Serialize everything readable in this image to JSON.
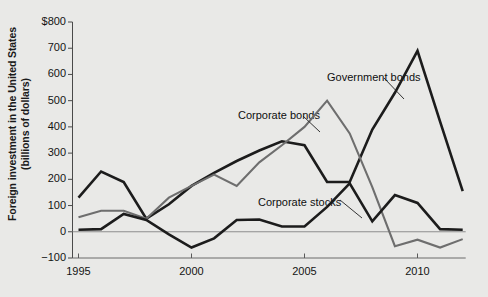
{
  "chart_data": {
    "type": "line",
    "title": "",
    "xlabel": "",
    "ylabel": "Foreign investment in the United States (billions of dollars)",
    "ylabel_line1": "Foreign investment in the United States",
    "ylabel_line2": "(billions of dollars)",
    "ylim": [
      -100,
      800
    ],
    "xlim": [
      1995,
      2012
    ],
    "ytick_labels": [
      "$800",
      "700",
      "600",
      "500",
      "400",
      "300",
      "200",
      "100",
      "0",
      "−100"
    ],
    "ytick_values": [
      800,
      700,
      600,
      500,
      400,
      300,
      200,
      100,
      0,
      -100
    ],
    "xtick_labels": [
      "1995",
      "2000",
      "2005",
      "2010"
    ],
    "xtick_values": [
      1995,
      2000,
      2005,
      2010
    ],
    "grid": false,
    "zero_line": true,
    "legend_position": "inline-annotations",
    "x": [
      1995,
      1996,
      1997,
      1998,
      1999,
      2000,
      2001,
      2002,
      2003,
      2004,
      2005,
      2006,
      2007,
      2008,
      2009,
      2010,
      2011,
      2012
    ],
    "series": [
      {
        "name": "Government bonds",
        "color": "#1c1c1c",
        "width": 2.6,
        "values": [
          130,
          230,
          190,
          50,
          105,
          175,
          225,
          270,
          310,
          345,
          330,
          190,
          190,
          390,
          530,
          690,
          420,
          155
        ]
      },
      {
        "name": "Corporate bonds",
        "color": "#6e6e6e",
        "width": 2.1,
        "values": [
          55,
          80,
          80,
          50,
          130,
          175,
          218,
          175,
          265,
          330,
          400,
          500,
          375,
          170,
          -55,
          -30,
          -60,
          -28
        ]
      },
      {
        "name": "Corporate stocks",
        "color": "#1c1c1c",
        "width": 2.6,
        "values": [
          8,
          10,
          68,
          45,
          -10,
          -60,
          -25,
          45,
          47,
          20,
          20,
          95,
          185,
          40,
          140,
          110,
          10,
          8
        ]
      }
    ],
    "annotations": [
      {
        "text": "Government bonds",
        "label_x": 327,
        "label_y": 71,
        "leader_from": [
          384,
          78
        ],
        "leader_to": [
          404,
          99
        ]
      },
      {
        "text": "Corporate bonds",
        "label_x": 238,
        "label_y": 109,
        "leader_from": [
          303,
          116
        ],
        "leader_to": [
          320,
          132
        ]
      },
      {
        "text": "Corporate stocks",
        "label_x": 258,
        "label_y": 196,
        "leader_from": [
          340,
          200
        ],
        "leader_to": [
          362,
          218
        ]
      }
    ]
  }
}
